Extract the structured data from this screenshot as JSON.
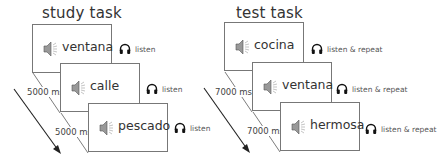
{
  "panels": [
    {
      "title": "study task",
      "trials": [
        {
          "word": "ventana",
          "instruction": "listen"
        },
        {
          "word": "calle",
          "instruction": "listen"
        },
        {
          "word": "pescado",
          "instruction": "listen"
        }
      ],
      "intervals": [
        "5000 ms",
        "5000 ms"
      ]
    },
    {
      "title": "test task",
      "trials": [
        {
          "word": "cocina",
          "instruction": "listen & repeat"
        },
        {
          "word": "ventana",
          "instruction": "listen & repeat"
        },
        {
          "word": "hermosa",
          "instruction": "listen & repeat"
        }
      ],
      "intervals": [
        "7000 ms",
        "7000 ms"
      ]
    }
  ],
  "icons": {
    "speaker": "speaker-icon",
    "headphones": "headphones-icon",
    "time_arrow": "arrow-icon"
  }
}
